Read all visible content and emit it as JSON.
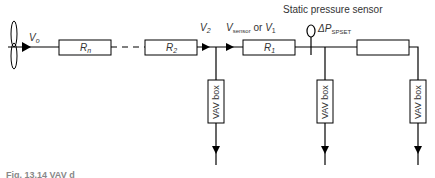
{
  "diagram": {
    "title_label": "Static pressure sensor",
    "fan_flow": {
      "main": "V",
      "sub": "o"
    },
    "resistors": [
      {
        "main": "R",
        "sub": "n"
      },
      {
        "main": "R",
        "sub": "2"
      },
      {
        "main": "R",
        "sub": "1"
      },
      {
        "main": "",
        "sub": ""
      }
    ],
    "flow_v2": {
      "main": "V",
      "sub": "2"
    },
    "flow_sensor": {
      "main": "V",
      "sub": "sensor",
      "or": " or ",
      "main2": "V",
      "sub2": "1"
    },
    "delta_p": {
      "main": "ΔP",
      "sub": "SPSET"
    },
    "vav_boxes": [
      "VAV box",
      "VAV box",
      "VAV box"
    ],
    "caption": "Fig. 13.14   VAV d"
  }
}
